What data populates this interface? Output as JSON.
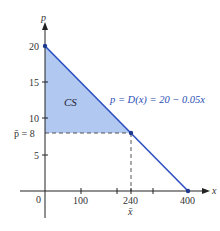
{
  "diagram": {
    "axes": {
      "x_label": "x",
      "y_label": "p",
      "origin_label": "0",
      "x_ticks": [
        "100",
        "240",
        "400"
      ],
      "x_tick_values": [
        100,
        200,
        240,
        300,
        400
      ],
      "y_ticks": [
        "5",
        "10",
        "15",
        "20"
      ],
      "x_bar_label": "x̄",
      "p_bar_label": "p̄ = 8"
    },
    "region_label": "CS",
    "curve_label": "p = D(x) = 20 − 0.05x",
    "points": [
      {
        "x": 0,
        "p": 20
      },
      {
        "x": 240,
        "p": 8
      },
      {
        "x": 400,
        "p": 0
      }
    ],
    "colors": {
      "line": "#2b4fc0",
      "fill": "#a9c2ee",
      "axis": "#222222",
      "dash": "#555555"
    }
  }
}
